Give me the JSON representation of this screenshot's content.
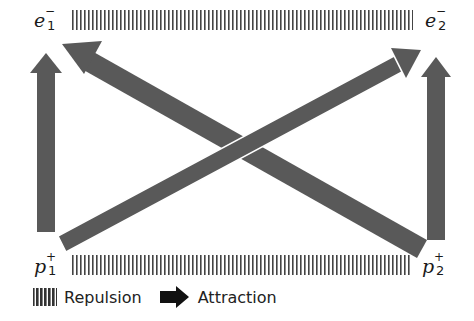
{
  "diagram": {
    "particles": [
      {
        "id": "e1",
        "symbol": "e",
        "charge": "−",
        "index": "1",
        "x": 30,
        "y": 14
      },
      {
        "id": "e2",
        "symbol": "e",
        "charge": "−",
        "index": "2",
        "x": 425,
        "y": 14
      },
      {
        "id": "p1",
        "symbol": "p",
        "charge": "+",
        "index": "1",
        "x": 30,
        "y": 256
      },
      {
        "id": "p2",
        "symbol": "p",
        "charge": "+",
        "index": "2",
        "x": 420,
        "y": 256
      }
    ],
    "repulsions": [
      {
        "from": "e1",
        "to": "e2",
        "x1": 70,
        "x2": 413,
        "y": 10,
        "height": 20
      },
      {
        "from": "p1",
        "to": "p2",
        "x1": 70,
        "x2": 410,
        "y": 255,
        "height": 20
      }
    ],
    "attractions": [
      {
        "from": "p1",
        "to": "e1",
        "direction": "up"
      },
      {
        "from": "p2",
        "to": "e2",
        "direction": "up"
      },
      {
        "from": "p1",
        "to": "e2",
        "direction": "diagonal"
      },
      {
        "from": "p2",
        "to": "e1",
        "direction": "diagonal"
      }
    ],
    "colors": {
      "arrow": "#595959",
      "hatch": "#444444",
      "text": "#1a1a1a"
    }
  },
  "legend": {
    "repulsion_label": "Repulsion",
    "attraction_label": "Attraction"
  }
}
